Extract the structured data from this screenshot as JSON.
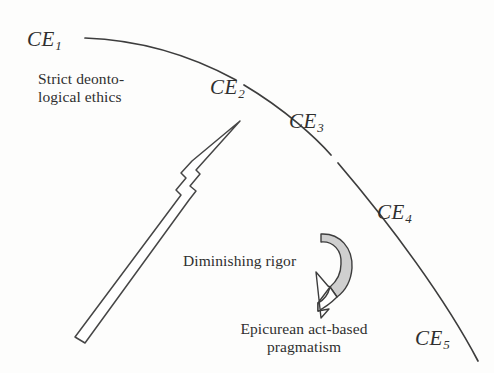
{
  "figure": {
    "background_color": "#fdfdfc",
    "stroke_color": "#3a3a3a",
    "shade_color": "#cfcfcf"
  },
  "arc_labels": [
    {
      "id": "ce1",
      "base": "CE",
      "sub": "1"
    },
    {
      "id": "ce2",
      "base": "CE",
      "sub": "2"
    },
    {
      "id": "ce3",
      "base": "CE",
      "sub": "3"
    },
    {
      "id": "ce4",
      "base": "CE",
      "sub": "4"
    },
    {
      "id": "ce5",
      "base": "CE",
      "sub": "5"
    }
  ],
  "annotations": {
    "top_left_line1": "Strict deonto-",
    "top_left_line2": "logical ethics",
    "middle": "Diminishing rigor",
    "bottom_line1": "Epicurean act-based",
    "bottom_line2": "pragmatism"
  },
  "shapes": {
    "big_arrow_name": "diminishing-rigor-arrow",
    "curved_arrow_name": "curved-shaded-arrow",
    "arc_name": "concentric-ethics-arc"
  }
}
